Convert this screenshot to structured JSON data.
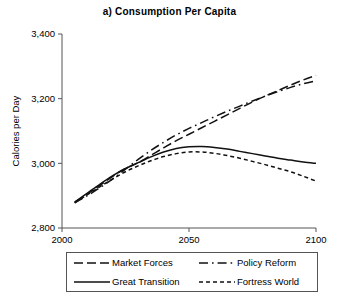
{
  "chart_data": {
    "type": "line",
    "title": "a) Consumption Per Capita",
    "xlabel": "",
    "ylabel": "Calories per Day",
    "xlim": [
      2000,
      2100
    ],
    "ylim": [
      2800,
      3400
    ],
    "xticks": [
      2000,
      2050,
      2100
    ],
    "xtick_labels": [
      "2000",
      "2050",
      "2100"
    ],
    "yticks": [
      2800,
      3000,
      3200,
      3400
    ],
    "ytick_labels": [
      "2,800",
      "3,000",
      "3,200",
      "3,400"
    ],
    "grid": false,
    "legend_position": "below-center",
    "x": [
      2005,
      2010,
      2015,
      2020,
      2025,
      2030,
      2035,
      2040,
      2045,
      2050,
      2055,
      2060,
      2065,
      2070,
      2075,
      2080,
      2085,
      2090,
      2095,
      2100
    ],
    "series": [
      {
        "name": "Market Forces",
        "dash": "long-dash",
        "values": [
          2880,
          2905,
          2932,
          2960,
          2984,
          3002,
          3025,
          3048,
          3070,
          3090,
          3110,
          3130,
          3150,
          3170,
          3190,
          3208,
          3225,
          3242,
          3258,
          3272
        ]
      },
      {
        "name": "Policy Reform",
        "dash": "dash-dot",
        "values": [
          2878,
          2900,
          2925,
          2952,
          2982,
          3012,
          3040,
          3065,
          3088,
          3108,
          3126,
          3144,
          3161,
          3177,
          3193,
          3208,
          3222,
          3235,
          3246,
          3255
        ]
      },
      {
        "name": "Great Transition",
        "dash": "solid",
        "values": [
          2880,
          2908,
          2936,
          2962,
          2984,
          3002,
          3020,
          3035,
          3046,
          3051,
          3052,
          3049,
          3044,
          3037,
          3030,
          3023,
          3016,
          3010,
          3004,
          3000
        ]
      },
      {
        "name": "Fortress World",
        "dash": "short-dash",
        "values": [
          2878,
          2903,
          2928,
          2952,
          2974,
          2992,
          3008,
          3021,
          3030,
          3035,
          3035,
          3031,
          3024,
          3016,
          3006,
          2996,
          2985,
          2974,
          2960,
          2945
        ]
      }
    ]
  },
  "legend": {
    "items": [
      {
        "label": "Market Forces",
        "dash": "long-dash"
      },
      {
        "label": "Policy Reform",
        "dash": "dash-dot"
      },
      {
        "label": "Great Transition",
        "dash": "solid"
      },
      {
        "label": "Fortress World",
        "dash": "short-dash"
      }
    ]
  }
}
